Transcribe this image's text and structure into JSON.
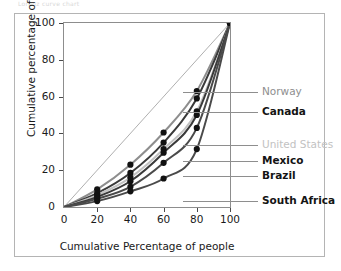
{
  "figure": {
    "top_strip_text": "Lorenz curve chart",
    "frame_color": "#b4b4b4",
    "background": "#ffffff"
  },
  "chart_data": {
    "type": "line",
    "title": "",
    "subtitle": "",
    "xlabel": "Cumulative Percentage of people",
    "ylabel": "Cumulative percentage of income",
    "xlim": [
      0,
      100
    ],
    "ylim": [
      0,
      100
    ],
    "xticks": [
      0,
      20,
      40,
      60,
      80,
      100
    ],
    "yticks": [
      0,
      20,
      40,
      60,
      80,
      100
    ],
    "xtick_labels": [
      "0",
      "20",
      "40",
      "60",
      "80",
      "100"
    ],
    "ytick_labels": [
      "0",
      "20",
      "40",
      "60",
      "80",
      "100"
    ],
    "grid": false,
    "legend_position": "right",
    "markers": "filled-circle",
    "reference_line": {
      "name": "line-of-equality",
      "x": [
        0,
        100
      ],
      "y": [
        0,
        100
      ],
      "color": "#9a9a9a",
      "width": 0.8
    },
    "x": [
      0,
      20,
      40,
      60,
      80,
      100
    ],
    "series": [
      {
        "name": "Norway",
        "values": [
          0,
          9.6,
          23.0,
          40.5,
          63.0,
          100
        ],
        "color": "#8e8e8e",
        "label_style": "gray",
        "width": 2.0
      },
      {
        "name": "Canada",
        "values": [
          0,
          7.5,
          18.5,
          35.0,
          59.0,
          100
        ],
        "color": "#3a3a3a",
        "label_style": "bold",
        "width": 2.0
      },
      {
        "name": "United States",
        "values": [
          0,
          6.5,
          16.0,
          31.5,
          52.0,
          100
        ],
        "color": "#c2c2c2",
        "label_style": "lgray",
        "width": 2.0
      },
      {
        "name": "Mexico",
        "values": [
          0,
          5.5,
          14.0,
          29.5,
          50.0,
          100
        ],
        "color": "#3a3a3a",
        "label_style": "bold",
        "width": 2.0
      },
      {
        "name": "Brazil",
        "values": [
          0,
          4.5,
          11.0,
          24.0,
          43.0,
          100
        ],
        "color": "#4a4a4a",
        "label_style": "bold",
        "width": 2.0
      },
      {
        "name": "South Africa",
        "values": [
          0,
          3.2,
          8.5,
          15.5,
          31.5,
          100
        ],
        "color": "#4a4a4a",
        "label_style": "bold",
        "width": 2.0
      }
    ],
    "legend": [
      {
        "label": "Norway",
        "style": "gray",
        "leader_y": 63.0,
        "color": "#8e8e8e"
      },
      {
        "label": "Canada",
        "style": "bold",
        "leader_y": 52.0,
        "color": "#8e8e8e"
      },
      {
        "label": "United States",
        "style": "lgray",
        "leader_y": 34.5,
        "color": "#8e8e8e"
      },
      {
        "label": "Mexico",
        "style": "bold",
        "leader_y": 25.5,
        "color": "#8e8e8e"
      },
      {
        "label": "Brazil",
        "style": "bold",
        "leader_y": 17.5,
        "color": "#8e8e8e"
      },
      {
        "label": "South Africa",
        "style": "bold",
        "leader_y": 4.0,
        "color": "#8e8e8e"
      }
    ]
  }
}
